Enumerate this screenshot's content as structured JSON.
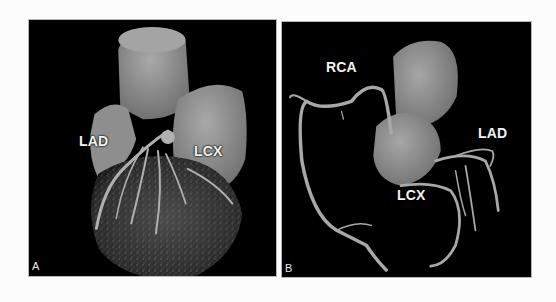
{
  "figure": {
    "panels": [
      {
        "id": "A",
        "letter": "A",
        "description": "3D volume-rendered CT of the heart, left coronary view",
        "labels": {
          "lad": "LAD",
          "lcx": "LCX"
        }
      },
      {
        "id": "B",
        "letter": "B",
        "description": "3D rendered coronary tree with aortic root",
        "labels": {
          "rca": "RCA",
          "lad": "LAD",
          "lcx": "LCX"
        }
      }
    ],
    "colors": {
      "background": "#fcfcfc",
      "panel_bg": "#000000",
      "tissue": "#9a9a9a",
      "vessel": "#a8a8a8",
      "label": "#f2f2f2"
    }
  }
}
